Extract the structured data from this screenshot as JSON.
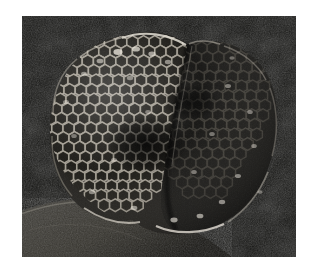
{
  "page": {
    "background_color": "#ffffff",
    "margins_px": {
      "left": 22,
      "top": 16,
      "right": 14,
      "bottom": 16
    }
  },
  "photograph": {
    "name": "wasp-nest-comb-photo",
    "subject": "wasp nest comb",
    "medium": "black and white photograph",
    "frame": {
      "x": 22,
      "y": 16,
      "width": 274,
      "height": 241
    },
    "background_color": "#111111",
    "background_texture": "fine dark grain",
    "tone_range": {
      "darkest": "#050505",
      "midtone": "#4a4a4a",
      "brightest": "#e8e6e2"
    },
    "elements": {
      "comb": {
        "name": "honeycomb-nest",
        "description": "rounded two-lobed wasp comb with hexagonal brood cells",
        "left_lobe": {
          "name": "comb-left-lobe",
          "description": "well lit hexagonal cells with pale rims and dark openings",
          "cell_wall_color": "#b9b4ab",
          "cell_interior_color": "#141312"
        },
        "right_lobe": {
          "name": "comb-right-lobe",
          "description": "shadowed lobe, cells less distinct, scattered bright highlights",
          "cell_wall_color": "#6e6a63",
          "cell_interior_color": "#0c0c0b"
        },
        "rim_highlight_color": "#ded9d0",
        "center_shadow": "dark depression between the two lobes"
      },
      "substrate": {
        "name": "rock-ledge",
        "description": "pale grey stone ledge crossing the lower left corner diagonally",
        "color": "#3b3a37"
      }
    }
  }
}
